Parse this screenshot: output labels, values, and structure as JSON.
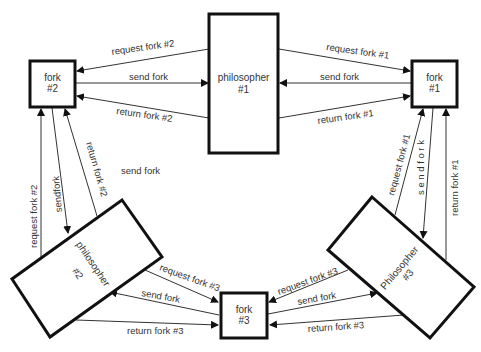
{
  "diagram": {
    "colors": {
      "stroke": "#111111",
      "line": "#333333",
      "text": "#333333",
      "background": "#ffffff"
    },
    "nodes": {
      "philosopher1": {
        "line1": "philosopher",
        "line2": "#1"
      },
      "philosopher2": {
        "line1": "philosopher",
        "line2": "#2"
      },
      "philosopher3": {
        "line1": "Philosopher",
        "line2": "#3"
      },
      "fork1": {
        "line1": "fork",
        "line2": "#1"
      },
      "fork2": {
        "line1": "fork",
        "line2": "#2"
      },
      "fork3": {
        "line1": "fork",
        "line2": "#3"
      }
    },
    "edges": {
      "p1_f2_request": "request fork #2",
      "f2_p1_send": "send fork",
      "p1_f2_return": "return fork #2",
      "p1_f1_request": "request fork #1",
      "f1_p1_send": "send fork",
      "p1_f1_return": "return fork #1",
      "p2_f2_request": "request fork #2",
      "f2_p2_send": "sendfork",
      "p2_f2_return": "return fork #2",
      "floating_send": "send fork",
      "p3_f1_request": "request fork #1",
      "f1_p3_send": "s e n d  f o r k",
      "p3_f1_return": "return fork #1",
      "p2_f3_request": "request fork #3",
      "f3_p2_send": "send fork",
      "p2_f3_return": "return fork #3",
      "p3_f3_request": "request fork #3",
      "f3_p3_send": "send fork",
      "p3_f3_return": "return fork #3"
    }
  }
}
